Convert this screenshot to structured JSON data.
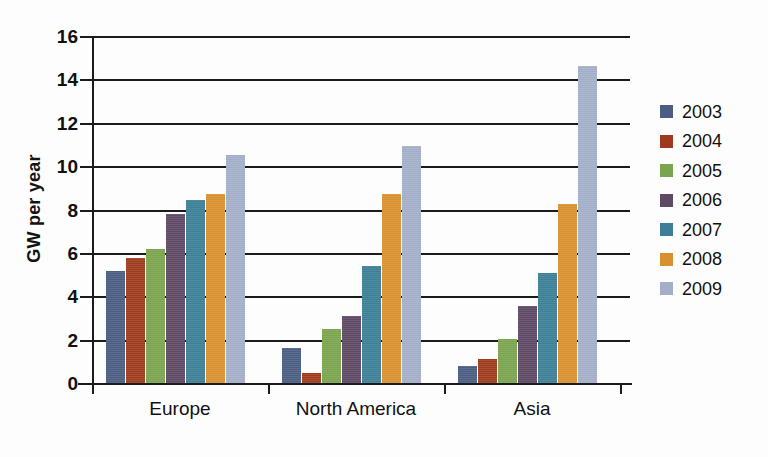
{
  "chart_data": {
    "type": "bar",
    "title": "",
    "xlabel": "",
    "ylabel": "GW per year",
    "categories": [
      "Europe",
      "North America",
      "Asia"
    ],
    "ylim": [
      0,
      16
    ],
    "yticks": [
      0,
      2,
      4,
      6,
      8,
      10,
      12,
      14,
      16
    ],
    "ytick_labels": [
      "0",
      "2",
      "4",
      "6",
      "8",
      "10",
      "12",
      "14",
      "16"
    ],
    "grid": true,
    "legend_position": "right",
    "series": [
      {
        "name": "2003",
        "color": "#4a5d82",
        "values": [
          5.15,
          1.6,
          0.8
        ]
      },
      {
        "name": "2004",
        "color": "#9e3b1f",
        "values": [
          5.75,
          0.45,
          1.1
        ]
      },
      {
        "name": "2005",
        "color": "#7ba44e",
        "values": [
          6.2,
          2.5,
          2.05
        ]
      },
      {
        "name": "2006",
        "color": "#5e4a66",
        "values": [
          7.8,
          3.1,
          3.55
        ]
      },
      {
        "name": "2007",
        "color": "#3c7f96",
        "values": [
          8.45,
          5.4,
          5.05
        ]
      },
      {
        "name": "2008",
        "color": "#d9912f",
        "values": [
          8.7,
          8.7,
          8.25
        ]
      },
      {
        "name": "2009",
        "color": "#a3aec8",
        "values": [
          10.5,
          10.95,
          14.6
        ]
      }
    ]
  },
  "caption": ""
}
